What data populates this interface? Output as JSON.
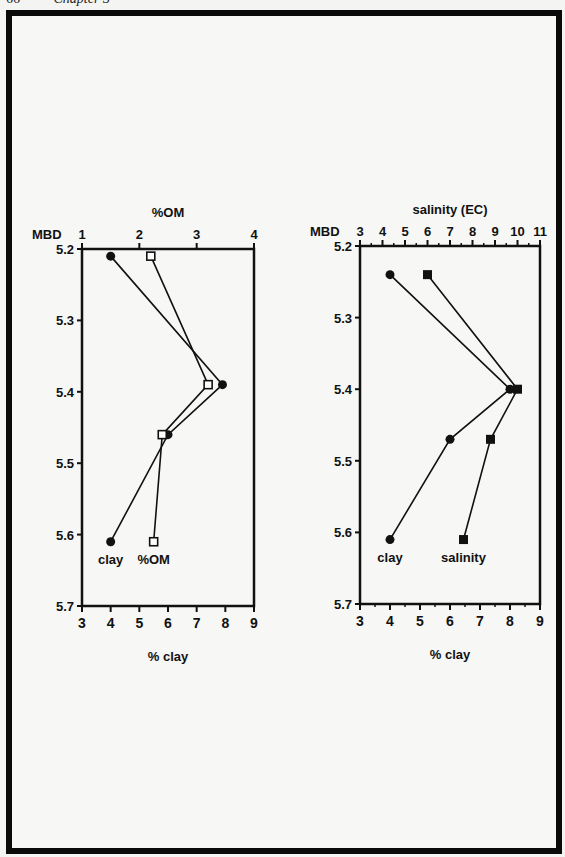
{
  "page": {
    "number": "66",
    "running_head": "Chapter 3"
  },
  "chart_data": [
    {
      "type": "line",
      "orientation": "vertical-profile",
      "title": "",
      "y_axis": {
        "label": "MBD",
        "ticks": [
          "5.2",
          "5.3",
          "5.4",
          "5.5",
          "5.6",
          "5.7"
        ],
        "range": [
          5.2,
          5.7
        ],
        "inverted": true
      },
      "x_axis_top": {
        "label": "%OM",
        "ticks": [
          "1",
          "2",
          "3",
          "4"
        ],
        "range": [
          1,
          4
        ]
      },
      "x_axis_bottom": {
        "label": "% clay",
        "ticks": [
          "3",
          "4",
          "5",
          "6",
          "7",
          "8",
          "9"
        ],
        "range": [
          3,
          9
        ]
      },
      "grid": false,
      "series": [
        {
          "name": "clay",
          "axis": "bottom",
          "marker": "filled-circle",
          "points": [
            {
              "x": 4.0,
              "mbd": 5.21
            },
            {
              "x": 7.9,
              "mbd": 5.39
            },
            {
              "x": 6.0,
              "mbd": 5.46
            },
            {
              "x": 4.0,
              "mbd": 5.61
            }
          ]
        },
        {
          "name": "%OM",
          "axis": "top",
          "marker": "open-square",
          "points": [
            {
              "x": 2.2,
              "mbd": 5.21
            },
            {
              "x": 3.2,
              "mbd": 5.39
            },
            {
              "x": 2.4,
              "mbd": 5.46
            },
            {
              "x": 2.25,
              "mbd": 5.61
            }
          ]
        }
      ],
      "annotations": [
        "clay",
        "%OM"
      ]
    },
    {
      "type": "line",
      "orientation": "vertical-profile",
      "title": "",
      "y_axis": {
        "label": "MBD",
        "ticks": [
          "5.2",
          "5.3",
          "5.4",
          "5.5",
          "5.6",
          "5.7"
        ],
        "range": [
          5.2,
          5.7
        ],
        "inverted": true
      },
      "x_axis_top": {
        "label": "salinity (EC)",
        "ticks": [
          "3",
          "4",
          "5",
          "6",
          "7",
          "8",
          "9",
          "10",
          "11"
        ],
        "range": [
          3,
          11
        ]
      },
      "x_axis_bottom": {
        "label": "% clay",
        "ticks": [
          "3",
          "4",
          "5",
          "6",
          "7",
          "8",
          "9"
        ],
        "range": [
          3,
          9
        ]
      },
      "grid": false,
      "series": [
        {
          "name": "clay",
          "axis": "bottom",
          "marker": "filled-circle",
          "points": [
            {
              "x": 4.0,
              "mbd": 5.24
            },
            {
              "x": 8.0,
              "mbd": 5.4
            },
            {
              "x": 6.0,
              "mbd": 5.47
            },
            {
              "x": 4.0,
              "mbd": 5.61
            }
          ]
        },
        {
          "name": "salinity",
          "axis": "top",
          "marker": "filled-square",
          "points": [
            {
              "x": 6.0,
              "mbd": 5.24
            },
            {
              "x": 10.0,
              "mbd": 5.4
            },
            {
              "x": 8.8,
              "mbd": 5.47
            },
            {
              "x": 7.6,
              "mbd": 5.61
            }
          ]
        }
      ],
      "annotations": [
        "clay",
        "salinity"
      ]
    }
  ]
}
